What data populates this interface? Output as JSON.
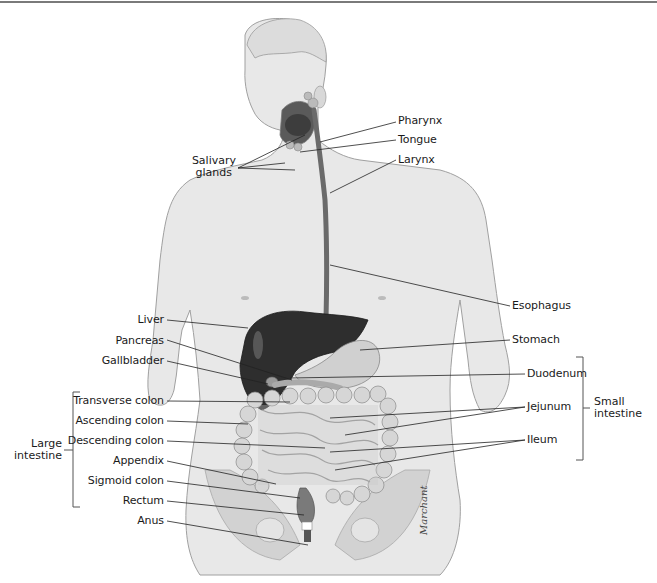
{
  "figure": {
    "signature": "Marchant",
    "colors": {
      "skin": "#e6e6e6",
      "outline": "#9a9a9a",
      "liver": "#2e2e2e",
      "organ_light": "#cfcfcf",
      "leader_line": "#222222",
      "text": "#1a1a1a"
    }
  },
  "labels_left": [
    {
      "id": "salivary",
      "text": "Salivary glands"
    },
    {
      "id": "liver",
      "text": "Liver"
    },
    {
      "id": "pancreas",
      "text": "Pancreas"
    },
    {
      "id": "gallbladder",
      "text": "Gallbladder"
    },
    {
      "id": "transverse",
      "text": "Transverse colon"
    },
    {
      "id": "ascending",
      "text": "Ascending colon"
    },
    {
      "id": "descending",
      "text": "Descending colon"
    },
    {
      "id": "appendix",
      "text": "Appendix"
    },
    {
      "id": "sigmoid",
      "text": "Sigmoid colon"
    },
    {
      "id": "rectum",
      "text": "Rectum"
    },
    {
      "id": "anus",
      "text": "Anus"
    }
  ],
  "labels_right": [
    {
      "id": "pharynx",
      "text": "Pharynx"
    },
    {
      "id": "tongue",
      "text": "Tongue"
    },
    {
      "id": "larynx",
      "text": "Larynx"
    },
    {
      "id": "esophagus",
      "text": "Esophagus"
    },
    {
      "id": "stomach",
      "text": "Stomach"
    },
    {
      "id": "duodenum",
      "text": "Duodenum"
    },
    {
      "id": "jejunum",
      "text": "Jejunum"
    },
    {
      "id": "ileum",
      "text": "Ileum"
    }
  ],
  "groups": {
    "large_intestine": {
      "line1": "Large",
      "line2": "intestine"
    },
    "small_intestine": {
      "line1": "Small",
      "line2": "intestine"
    },
    "salivary": {
      "line1": "Salivary",
      "line2": "glands"
    }
  }
}
